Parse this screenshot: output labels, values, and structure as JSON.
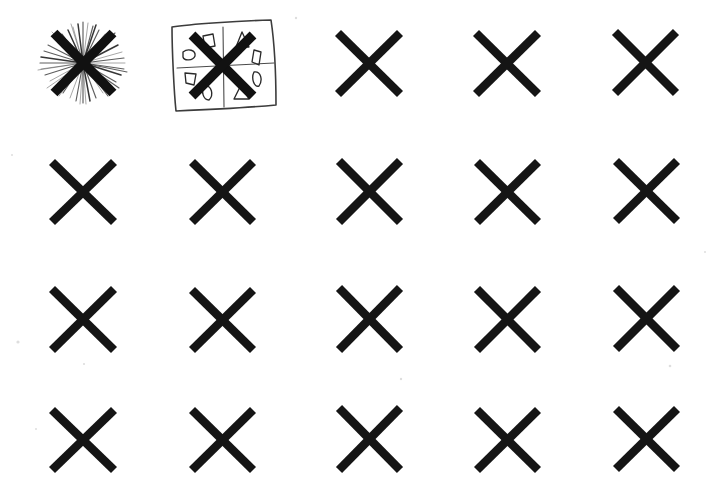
{
  "page": {
    "background_color": "#ffffff",
    "ink_color": "#151515",
    "width": 726,
    "height": 489,
    "medium_note": "scanned pen-and-ink drawing on white paper"
  },
  "grid": {
    "rows": 4,
    "columns": 5,
    "total_cells": 20,
    "column_centers": [
      83,
      222,
      369,
      507,
      645
    ],
    "row_centers": [
      63,
      192,
      320,
      440
    ],
    "x_mark_size": 62,
    "x_stroke_width": 8.6
  },
  "cells": [
    {
      "row": 1,
      "col": 1,
      "type": "x-starburst",
      "label": "X with radiating starburst scribble",
      "cx": 83,
      "cy": 63,
      "size": 62
    },
    {
      "row": 1,
      "col": 2,
      "type": "x-in-box",
      "label": "X inside hand-drawn square with sector shapes",
      "cx": 222,
      "cy": 64,
      "size": 62
    },
    {
      "row": 1,
      "col": 3,
      "type": "x",
      "label": "X mark",
      "cx": 369,
      "cy": 63,
      "size": 62
    },
    {
      "row": 1,
      "col": 4,
      "type": "x",
      "label": "X mark",
      "cx": 507,
      "cy": 63,
      "size": 62
    },
    {
      "row": 1,
      "col": 5,
      "type": "x",
      "label": "X mark",
      "cx": 645,
      "cy": 63,
      "size": 62
    },
    {
      "row": 2,
      "col": 1,
      "type": "x",
      "label": "X mark",
      "cx": 83,
      "cy": 192,
      "size": 62
    },
    {
      "row": 2,
      "col": 2,
      "type": "x",
      "label": "X mark",
      "cx": 222,
      "cy": 192,
      "size": 62
    },
    {
      "row": 2,
      "col": 3,
      "type": "x",
      "label": "X mark",
      "cx": 369,
      "cy": 192,
      "size": 62
    },
    {
      "row": 2,
      "col": 4,
      "type": "x",
      "label": "X mark",
      "cx": 507,
      "cy": 192,
      "size": 62
    },
    {
      "row": 2,
      "col": 5,
      "type": "x",
      "label": "X mark",
      "cx": 645,
      "cy": 192,
      "size": 62
    },
    {
      "row": 3,
      "col": 1,
      "type": "x",
      "label": "X mark",
      "cx": 83,
      "cy": 320,
      "size": 62
    },
    {
      "row": 3,
      "col": 2,
      "type": "x",
      "label": "X mark",
      "cx": 222,
      "cy": 320,
      "size": 62
    },
    {
      "row": 3,
      "col": 3,
      "type": "x",
      "label": "X mark",
      "cx": 369,
      "cy": 320,
      "size": 62
    },
    {
      "row": 3,
      "col": 4,
      "type": "x",
      "label": "X mark",
      "cx": 507,
      "cy": 320,
      "size": 62
    },
    {
      "row": 3,
      "col": 5,
      "type": "x",
      "label": "X mark",
      "cx": 645,
      "cy": 320,
      "size": 62
    },
    {
      "row": 4,
      "col": 1,
      "type": "x",
      "label": "X mark",
      "cx": 83,
      "cy": 440,
      "size": 62
    },
    {
      "row": 4,
      "col": 2,
      "type": "x",
      "label": "X mark",
      "cx": 222,
      "cy": 440,
      "size": 62
    },
    {
      "row": 4,
      "col": 3,
      "type": "x",
      "label": "X mark",
      "cx": 369,
      "cy": 440,
      "size": 62
    },
    {
      "row": 4,
      "col": 4,
      "type": "x",
      "label": "X mark",
      "cx": 507,
      "cy": 440,
      "size": 62
    },
    {
      "row": 4,
      "col": 5,
      "type": "x",
      "label": "X mark",
      "cx": 645,
      "cy": 440,
      "size": 62
    }
  ],
  "starburst": {
    "ray_count": 46,
    "min_length": 17,
    "max_length": 41,
    "color": "#3a3a3a"
  },
  "boxed_figure": {
    "box": {
      "label": "hand-drawn square frame",
      "path": "M 172,26 L 272,20 L 276,105 L 175,111 Z"
    },
    "dividers": [
      {
        "name": "vertical-divider",
        "x1": 223,
        "y1": 26,
        "x2": 224,
        "y2": 106
      },
      {
        "name": "horizontal-divider",
        "x1": 177,
        "y1": 67,
        "x2": 274,
        "y2": 63
      }
    ],
    "sector_shapes": [
      {
        "sector": "N-left",
        "shape": "quadrilateral",
        "cx": 208,
        "cy": 41
      },
      {
        "sector": "N-right",
        "shape": "triangle",
        "cx": 242,
        "cy": 40
      },
      {
        "sector": "W-upper",
        "shape": "oval",
        "cx": 188,
        "cy": 55
      },
      {
        "sector": "E-upper",
        "shape": "quadrilateral",
        "cx": 256,
        "cy": 57
      },
      {
        "sector": "W-lower",
        "shape": "quadrilateral",
        "cx": 190,
        "cy": 79
      },
      {
        "sector": "E-lower",
        "shape": "oval",
        "cx": 258,
        "cy": 79
      },
      {
        "sector": "S-left",
        "shape": "oval",
        "cx": 208,
        "cy": 93
      },
      {
        "sector": "S-right",
        "shape": "triangle",
        "cx": 241,
        "cy": 93
      }
    ]
  }
}
